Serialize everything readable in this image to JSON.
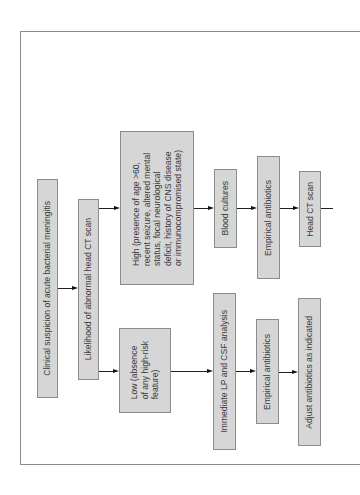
{
  "diagram": {
    "orientation": "rotated-90-ccw",
    "colors": {
      "box_fill": "#d6d6d6",
      "box_border": "#8c8c8c",
      "text": "#3a3a3a",
      "arrow": "#222222",
      "frame": "#8a8a8a"
    },
    "nodes": {
      "start": {
        "label": "Clinical suspicion of acute bacterial meningitis"
      },
      "likelihood": {
        "label": "Likelihood of abnormal head CT scan"
      },
      "high": {
        "label": "High (presence of age >60,\nrecent seizure, altered mental\nstatus, focal neurological\ndeficit, history of CNS disease\nor immunocompromised state)"
      },
      "low": {
        "label": "Low (absence\nof any high-risk\nfeature)"
      },
      "blood_cultures": {
        "label": "Blood cultures"
      },
      "empirical_high": {
        "label": "Empirical antibiotics"
      },
      "head_ct": {
        "label": "Head CT scan"
      },
      "immediate_lp": {
        "label": "Immediate LP and CSF analysis"
      },
      "empirical_low": {
        "label": "Empirical antibiotics"
      },
      "adjust": {
        "label": "Adjust antibiotics as indicated"
      }
    },
    "edges": [
      {
        "from": "start",
        "to": "likelihood"
      },
      {
        "from": "likelihood",
        "to": "high"
      },
      {
        "from": "likelihood",
        "to": "low"
      },
      {
        "from": "high",
        "to": "blood_cultures"
      },
      {
        "from": "blood_cultures",
        "to": "empirical_high"
      },
      {
        "from": "empirical_high",
        "to": "head_ct"
      },
      {
        "from": "low",
        "to": "immediate_lp"
      },
      {
        "from": "immediate_lp",
        "to": "empirical_low"
      },
      {
        "from": "empirical_low",
        "to": "adjust"
      }
    ]
  }
}
